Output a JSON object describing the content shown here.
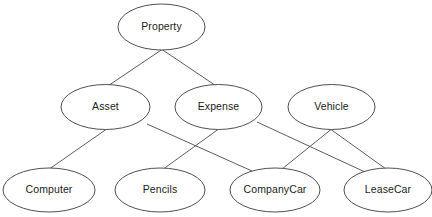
{
  "diagram": {
    "type": "node-link-graph",
    "background_color": "#ffffff",
    "node_fill_color": "#ffffff",
    "node_stroke_color": "#3c3c3c",
    "edge_stroke_color": "#4a4a4a",
    "label_color": "#1c1c1c",
    "nodes": [
      {
        "id": "property",
        "label": "Property",
        "cx": 161.5,
        "cy": 27,
        "rx": 43.5,
        "ry": 23,
        "level": 0
      },
      {
        "id": "asset",
        "label": "Asset",
        "cx": 105.5,
        "cy": 107,
        "rx": 44.5,
        "ry": 22.5,
        "level": 1
      },
      {
        "id": "expense",
        "label": "Expense",
        "cx": 218.5,
        "cy": 107,
        "rx": 43.5,
        "ry": 22.5,
        "level": 1
      },
      {
        "id": "vehicle",
        "label": "Vehicle",
        "cx": 331.5,
        "cy": 107,
        "rx": 43.5,
        "ry": 22.5,
        "level": 1
      },
      {
        "id": "computer",
        "label": "Computer",
        "cx": 49,
        "cy": 190,
        "rx": 46,
        "ry": 22,
        "level": 2
      },
      {
        "id": "pencils",
        "label": "Pencils",
        "cx": 160,
        "cy": 190,
        "rx": 45,
        "ry": 22,
        "level": 2
      },
      {
        "id": "companycar",
        "label": "CompanyCar",
        "cx": 275,
        "cy": 190,
        "rx": 45,
        "ry": 22,
        "level": 2
      },
      {
        "id": "leasecar",
        "label": "LeaseCar",
        "cx": 388,
        "cy": 190,
        "rx": 44,
        "ry": 22,
        "level": 2
      }
    ],
    "edges": [
      {
        "id": "edge-property-asset",
        "from": "property",
        "to": "asset",
        "x1": 162,
        "y1": 49.5,
        "x2": 107,
        "y2": 86.5
      },
      {
        "id": "edge-property-expense",
        "from": "property",
        "to": "expense",
        "x1": 162,
        "y1": 49.5,
        "x2": 217,
        "y2": 86.5
      },
      {
        "id": "edge-asset-computer",
        "from": "asset",
        "to": "computer",
        "x1": 106,
        "y1": 129.5,
        "x2": 50,
        "y2": 168.5
      },
      {
        "id": "edge-asset-companycar",
        "from": "asset",
        "to": "companycar",
        "x1": 147,
        "y1": 124,
        "x2": 252,
        "y2": 171
      },
      {
        "id": "edge-expense-pencils",
        "from": "expense",
        "to": "pencils",
        "x1": 218,
        "y1": 129.5,
        "x2": 164,
        "y2": 168.5
      },
      {
        "id": "edge-expense-leasecar",
        "from": "expense",
        "to": "leasecar",
        "x1": 257,
        "y1": 122,
        "x2": 365,
        "y2": 172
      },
      {
        "id": "edge-vehicle-companycar",
        "from": "vehicle",
        "to": "companycar",
        "x1": 331,
        "y1": 129.5,
        "x2": 282,
        "y2": 169
      },
      {
        "id": "edge-vehicle-leasecar",
        "from": "vehicle",
        "to": "leasecar",
        "x1": 331,
        "y1": 129.5,
        "x2": 386,
        "y2": 169
      }
    ]
  }
}
